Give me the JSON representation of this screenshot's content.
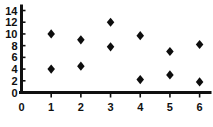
{
  "chart_data": {
    "type": "scatter",
    "title": "",
    "subtitle": "",
    "xlabel": "",
    "ylabel": "",
    "xlim": [
      0,
      6.35
    ],
    "ylim": [
      0,
      14.6
    ],
    "xticks": [
      0,
      1,
      2,
      3,
      4,
      5,
      6
    ],
    "yticks": [
      0,
      2,
      4,
      6,
      8,
      10,
      12,
      14
    ],
    "xtick_labels": [
      "0",
      "1",
      "2",
      "3",
      "4",
      "5",
      "6"
    ],
    "ytick_labels": [
      "0",
      "2",
      "4",
      "6",
      "8",
      "10",
      "12",
      "14"
    ],
    "grid": false,
    "legend": false,
    "legend_position": "none",
    "marker": "diamond",
    "marker_color": "#0d0d0d",
    "axis_color": "#101010",
    "background_color": "#ffffff",
    "series": [
      {
        "name": "series-1",
        "points": [
          {
            "x": 1,
            "y": 10.0
          },
          {
            "x": 2,
            "y": 9.0
          },
          {
            "x": 3,
            "y": 12.0
          },
          {
            "x": 4,
            "y": 9.7
          },
          {
            "x": 5,
            "y": 7.0
          },
          {
            "x": 6,
            "y": 8.2
          }
        ]
      },
      {
        "name": "series-2",
        "points": [
          {
            "x": 1,
            "y": 4.0
          },
          {
            "x": 2,
            "y": 4.5
          },
          {
            "x": 3,
            "y": 7.8
          },
          {
            "x": 4,
            "y": 2.2
          },
          {
            "x": 5,
            "y": 3.0
          },
          {
            "x": 6,
            "y": 1.8
          }
        ]
      }
    ],
    "all_points": [
      {
        "x": 1,
        "y": 10.0
      },
      {
        "x": 1,
        "y": 4.0
      },
      {
        "x": 2,
        "y": 9.0
      },
      {
        "x": 2,
        "y": 4.5
      },
      {
        "x": 3,
        "y": 12.0
      },
      {
        "x": 3,
        "y": 7.8
      },
      {
        "x": 4,
        "y": 9.7
      },
      {
        "x": 4,
        "y": 2.2
      },
      {
        "x": 5,
        "y": 7.0
      },
      {
        "x": 5,
        "y": 3.0
      },
      {
        "x": 6,
        "y": 8.2
      },
      {
        "x": 6,
        "y": 1.8
      }
    ]
  }
}
